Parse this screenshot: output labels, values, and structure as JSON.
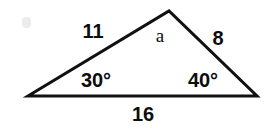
{
  "figure": {
    "kind": "triangle-diagram",
    "stroke_color": "#111111",
    "background_color": "#ffffff",
    "text_color": "#0d0d0d",
    "stroke_width": 3,
    "vertices": {
      "left": {
        "x": 28,
        "y": 96
      },
      "apex": {
        "x": 169,
        "y": 11
      },
      "right": {
        "x": 257,
        "y": 96
      }
    },
    "labels": {
      "side_left": {
        "text": "11",
        "x": 93,
        "y": 31
      },
      "side_right": {
        "text": "8",
        "x": 218,
        "y": 38
      },
      "side_bottom": {
        "text": "16",
        "x": 143,
        "y": 114
      },
      "angle_left": {
        "text": "30°",
        "x": 96,
        "y": 80
      },
      "angle_right": {
        "text": "40°",
        "x": 203,
        "y": 80
      },
      "angle_apex": {
        "text": "a",
        "x": 160,
        "y": 35
      }
    }
  }
}
